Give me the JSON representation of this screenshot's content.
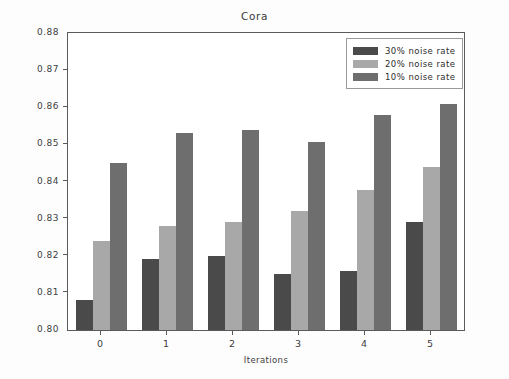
{
  "chart_data": {
    "type": "bar",
    "title": "Cora",
    "xlabel": "Iterations",
    "ylabel": "Accuracy",
    "categories": [
      "0",
      "1",
      "2",
      "3",
      "4",
      "5"
    ],
    "ylim": [
      0.8,
      0.88
    ],
    "yticks": [
      "0.80",
      "0.81",
      "0.82",
      "0.83",
      "0.84",
      "0.85",
      "0.86",
      "0.87",
      "0.88"
    ],
    "ytick_values": [
      0.8,
      0.81,
      0.82,
      0.83,
      0.84,
      0.85,
      0.86,
      0.87,
      0.88
    ],
    "grid": false,
    "legend_position": "upper right",
    "series": [
      {
        "name": "30% noise rate",
        "color": "#4a4a4a",
        "values": [
          0.808,
          0.8192,
          0.82,
          0.815,
          0.816,
          0.829
        ]
      },
      {
        "name": "20% noise rate",
        "color": "#a8a8a8",
        "values": [
          0.824,
          0.828,
          0.829,
          0.832,
          0.8378,
          0.844
        ]
      },
      {
        "name": "10% noise rate",
        "color": "#6e6e6e",
        "values": [
          0.845,
          0.853,
          0.8538,
          0.8507,
          0.858,
          0.861
        ]
      }
    ]
  },
  "figure": {
    "background": "#fdfdfd",
    "plot_background": "#ffffff",
    "axis_color": "#5a5a5a"
  }
}
